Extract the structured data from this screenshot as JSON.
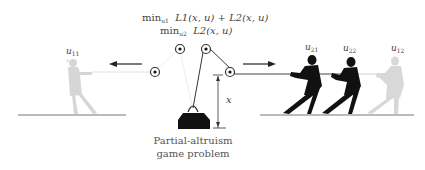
{
  "formulas": {
    "line1": {
      "min": "min",
      "sub": "u1",
      "expr": "L1(x, u) + L2(x, u)"
    },
    "line2": {
      "min": "min",
      "sub": "u2",
      "expr": "L2(x, u)"
    }
  },
  "players": [
    {
      "id": "u11",
      "label_base": "u",
      "label_sub": "11",
      "color": "#d4d4d4",
      "side": "left"
    },
    {
      "id": "u21",
      "label_base": "u",
      "label_sub": "21",
      "color": "#111111",
      "side": "right"
    },
    {
      "id": "u22",
      "label_base": "u",
      "label_sub": "22",
      "color": "#111111",
      "side": "right"
    },
    {
      "id": "u12",
      "label_base": "u",
      "label_sub": "12",
      "color": "#d4d4d4",
      "side": "right"
    }
  ],
  "dimension_label": "x",
  "caption": {
    "line1": "Partial-altruism",
    "line2": "game problem"
  },
  "colors": {
    "dark_figure": "#111111",
    "light_figure": "#d4d4d4",
    "rope_dark": "#333333",
    "rope_light": "#dddddd",
    "ground": "#666666",
    "weight": "#111111"
  }
}
